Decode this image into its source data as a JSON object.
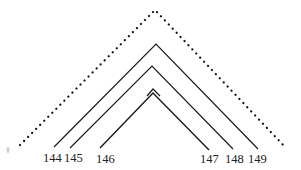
{
  "diagram": {
    "type": "nested-arc-diagram",
    "stroke_color": "#1a1a1a",
    "dotted_arc": {
      "left": [
        20,
        145
      ],
      "apex": [
        155,
        10
      ],
      "right": [
        286,
        148
      ]
    },
    "arcs": [
      {
        "id": "outer",
        "left_label": "144",
        "right_label": "149",
        "left": [
          54,
          147
        ],
        "apex": [
          156,
          44
        ],
        "right": [
          258,
          149
        ]
      },
      {
        "id": "middle",
        "left_label": "145",
        "right_label": "148",
        "left": [
          70,
          148
        ],
        "apex": [
          152,
          66
        ],
        "right": [
          233,
          149
        ]
      },
      {
        "id": "inner",
        "left_label": "146",
        "right_label": "147",
        "left": [
          100,
          148
        ],
        "apex": [
          153,
          91
        ],
        "right": [
          209,
          150
        ]
      }
    ],
    "labels": [
      {
        "text": "144",
        "x": 43,
        "y": 162
      },
      {
        "text": "145",
        "x": 64,
        "y": 162
      },
      {
        "text": "146",
        "x": 96,
        "y": 163
      },
      {
        "text": "147",
        "x": 200,
        "y": 163
      },
      {
        "text": "148",
        "x": 225,
        "y": 163
      },
      {
        "text": "149",
        "x": 248,
        "y": 163
      }
    ]
  }
}
